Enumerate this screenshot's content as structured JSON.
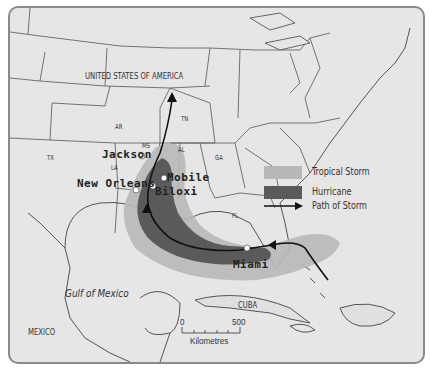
{
  "map": {
    "type": "storm-path map",
    "colors": {
      "background": "#e6e6e6",
      "border": "#8a8a8a",
      "state_lines": "#555555",
      "tropical_storm": "#b8b8b8",
      "hurricane": "#5a5a5a",
      "path": "#111111",
      "city_marker": "#ffffff"
    },
    "region_labels": {
      "country_usa": "UNITED STATES OF AMERICA",
      "country_mexico": "MEXICO",
      "country_cuba": "CUBA",
      "water_gulf": "Gulf of Mexico"
    },
    "state_labels": {
      "tx": "TX",
      "ar": "AR",
      "la": "LA",
      "ms": "MS",
      "al": "AL",
      "tn": "TN",
      "ga": "GA",
      "fl": "FL"
    },
    "cities": [
      {
        "name": "Jackson"
      },
      {
        "name": "New Orleans"
      },
      {
        "name": "Mobile"
      },
      {
        "name": "Biloxi"
      },
      {
        "name": "Miami"
      }
    ],
    "legend": {
      "items": [
        {
          "label": "Tropical Storm",
          "color": "#b8b8b8"
        },
        {
          "label": "Hurricane",
          "color": "#5a5a5a"
        },
        {
          "label": "Path of Storm",
          "symbol": "arrow"
        }
      ]
    },
    "scale_bar": {
      "start": "0",
      "end": "500",
      "unit": "Kilometres"
    }
  }
}
